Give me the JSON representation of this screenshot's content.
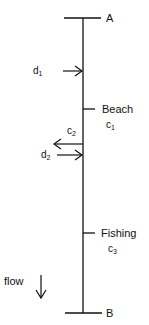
{
  "diagram": {
    "type": "river-schematic",
    "endpoints": {
      "top": {
        "label": "A"
      },
      "bottom": {
        "label": "B"
      }
    },
    "inputs": [
      {
        "id": "d1",
        "letter": "d",
        "index": "1",
        "direction": "into-river"
      },
      {
        "id": "d2",
        "letter": "d",
        "index": "2",
        "direction": "into-river"
      }
    ],
    "outputs": [
      {
        "id": "c2",
        "letter": "c",
        "index": "2",
        "direction": "out-of-river"
      }
    ],
    "sites": [
      {
        "name": "Beach",
        "letter": "c",
        "index": "1"
      },
      {
        "name": "Fishing",
        "letter": "c",
        "index": "3"
      }
    ],
    "flow": {
      "label": "flow",
      "direction": "down"
    },
    "colors": {
      "line": "#111111",
      "background": "#ffffff"
    }
  }
}
